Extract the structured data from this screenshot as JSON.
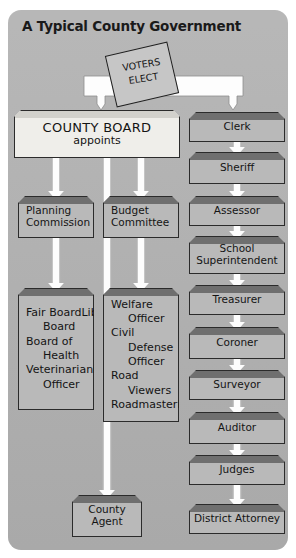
{
  "title": "A Typical County Government",
  "ballot": {
    "line1": "VOTERS",
    "line2": "ELECT",
    "name": "voters-elect-ballot"
  },
  "board": {
    "title": "COUNTY BOARD",
    "subtitle": "appoints"
  },
  "appointed": {
    "commissions": [
      {
        "label": "Planning\nCommission"
      },
      {
        "label": "Budget\nCommittee"
      }
    ],
    "lists": [
      {
        "name": "appointed-list-left",
        "items": [
          {
            "text": "Fair Board",
            "indent": false
          },
          {
            "text": "Library",
            "indent": false
          },
          {
            "text": "Board",
            "indent": true
          },
          {
            "text": "Board of",
            "indent": false
          },
          {
            "text": "Health",
            "indent": true
          },
          {
            "text": "Veterinarian",
            "indent": false
          },
          {
            "text": "Health",
            "indent": false
          },
          {
            "text": "Officer",
            "indent": true
          }
        ]
      },
      {
        "name": "appointed-list-middle",
        "items": [
          {
            "text": "Welfare",
            "indent": false
          },
          {
            "text": "Officer",
            "indent": true
          },
          {
            "text": "Civil",
            "indent": false
          },
          {
            "text": "Defense",
            "indent": true
          },
          {
            "text": "Officer",
            "indent": true
          },
          {
            "text": "Road",
            "indent": false
          },
          {
            "text": "Viewers",
            "indent": true
          },
          {
            "text": "Roadmaster",
            "indent": false
          },
          {
            "text": "Engineer",
            "indent": false
          }
        ]
      }
    ],
    "county_agent": "County\nAgent"
  },
  "elected": [
    {
      "label": "Clerk"
    },
    {
      "label": "Sheriff"
    },
    {
      "label": "Assessor"
    },
    {
      "label": "School\nSuperintendent"
    },
    {
      "label": "Treasurer"
    },
    {
      "label": "Coroner"
    },
    {
      "label": "Surveyor"
    },
    {
      "label": "Auditor"
    },
    {
      "label": "Judges"
    },
    {
      "label": "District Attorney"
    }
  ],
  "colors": {
    "panel_bg": "#b2b2b2",
    "box_fill": "#b9b9b9",
    "box_bevel": "#6f6f6f",
    "board_fill": "#efeeea",
    "ribbon": "#fdfdfd",
    "outline": "#2b2b2b",
    "text": "#141414"
  }
}
